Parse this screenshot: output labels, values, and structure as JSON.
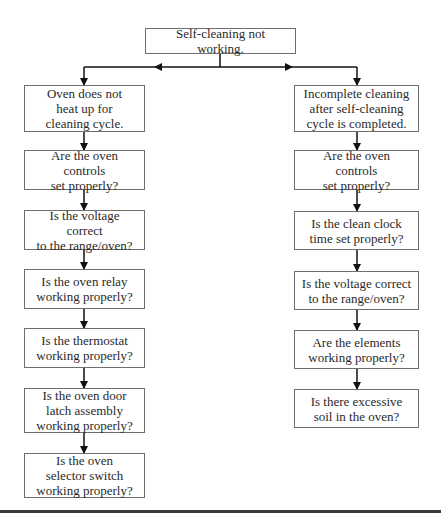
{
  "root": {
    "label": "Self-cleaning not working."
  },
  "branches": [
    {
      "title": "Oven does not\nheat up for\ncleaning cycle.",
      "steps": [
        "Are the oven controls\nset properly?",
        "Is the voltage correct\nto the range/oven?",
        "Is the oven relay\nworking properly?",
        "Is the thermostat\nworking properly?",
        "Is the oven door\nlatch assembly\nworking properly?",
        "Is the oven\nselector switch\nworking properly?"
      ]
    },
    {
      "title": "Incomplete cleaning\nafter self-cleaning\ncycle is completed.",
      "steps": [
        "Are the oven controls\nset properly?",
        "Is the clean clock\ntime set properly?",
        "Is the voltage correct\nto the range/oven?",
        "Are the elements\nworking properly?",
        "Is there excessive\nsoil in the oven?"
      ]
    }
  ],
  "colors": {
    "line": "#111111",
    "box_border": "#6e6e6e",
    "text": "#2a2a2a"
  }
}
